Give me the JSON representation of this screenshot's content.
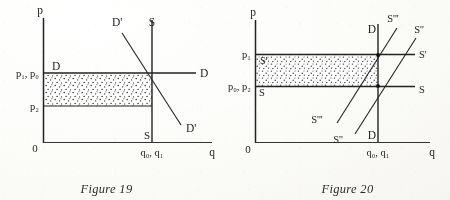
{
  "document": {
    "kind": "textbook-figure-pair",
    "ink_color": "#1d1d1d",
    "paper_color": "#fbfaf7"
  },
  "figure19": {
    "caption": "Figure 19",
    "axes": {
      "y_label": "p",
      "x_label": "q",
      "origin_label": "0"
    },
    "price_ticks": [
      {
        "id": "p1p0",
        "label": "p₁, p₀"
      },
      {
        "id": "p2",
        "label": "p₂"
      }
    ],
    "quantity_ticks": [
      {
        "id": "q0q1",
        "label": "q₀, q₁"
      }
    ],
    "curve_labels": [
      {
        "id": "demand-left",
        "label": "D"
      },
      {
        "id": "demand-right",
        "label": "D"
      },
      {
        "id": "demand-shift-top",
        "label": "D'"
      },
      {
        "id": "demand-shift-bottom",
        "label": "D'"
      },
      {
        "id": "supply-top",
        "label": "S"
      },
      {
        "id": "supply-bottom",
        "label": "S"
      }
    ],
    "shaded_region": {
      "name": "consumer-surplus-transfer",
      "pattern": "stipple-dots"
    }
  },
  "figure20": {
    "caption": "Figure 20",
    "axes": {
      "y_label": "p",
      "x_label": "q",
      "origin_label": "0"
    },
    "price_ticks": [
      {
        "id": "p1",
        "label": "p₁"
      },
      {
        "id": "p0p2",
        "label": "p₀, p₂"
      }
    ],
    "quantity_ticks": [
      {
        "id": "q0q1",
        "label": "q₀, q₁"
      }
    ],
    "curve_labels": [
      {
        "id": "supply-upper-left",
        "label": "S'"
      },
      {
        "id": "supply-upper-right",
        "label": "S'"
      },
      {
        "id": "supply-lower-left",
        "label": "S"
      },
      {
        "id": "supply-lower-right",
        "label": "S"
      },
      {
        "id": "supply-steep-top",
        "label": "S'''"
      },
      {
        "id": "supply-steep-bottom",
        "label": "S'''"
      },
      {
        "id": "supply-shallow-top",
        "label": "S''"
      },
      {
        "id": "supply-shallow-bottom",
        "label": "S''"
      },
      {
        "id": "demand-top",
        "label": "D"
      },
      {
        "id": "demand-bottom",
        "label": "D"
      }
    ],
    "shaded_region": {
      "name": "producer-surplus-transfer",
      "pattern": "stipple-dots"
    }
  }
}
